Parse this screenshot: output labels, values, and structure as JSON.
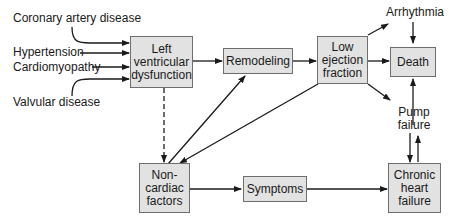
{
  "diagram": {
    "inputs": [
      {
        "id": "coronary",
        "label": "Coronary artery disease"
      },
      {
        "id": "hypertension",
        "label": "Hypertension"
      },
      {
        "id": "cardiomyopathy",
        "label": "Cardiomyopathy"
      },
      {
        "id": "valvular",
        "label": "Valvular disease"
      }
    ],
    "nodes": {
      "lv_dysfunction": "Left\nventricular\ndysfunction",
      "remodeling": "Remodeling",
      "low_ef": "Low\nejection\nfraction",
      "death": "Death",
      "arrhythmia": "Arrhythmia",
      "pump_failure": "Pump\nfailure",
      "noncardiac": "Non-\ncardiac\nfactors",
      "symptoms": "Symptoms",
      "chf": "Chronic\nheart\nfailure"
    },
    "edges": [
      {
        "from": "Coronary artery disease",
        "to": "Left ventricular dysfunction"
      },
      {
        "from": "Hypertension",
        "to": "Left ventricular dysfunction"
      },
      {
        "from": "Cardiomyopathy",
        "to": "Left ventricular dysfunction"
      },
      {
        "from": "Valvular disease",
        "to": "Left ventricular dysfunction"
      },
      {
        "from": "Left ventricular dysfunction",
        "to": "Remodeling"
      },
      {
        "from": "Left ventricular dysfunction",
        "to": "Non-cardiac factors",
        "style": "dashed"
      },
      {
        "from": "Remodeling",
        "to": "Low ejection fraction"
      },
      {
        "from": "Non-cardiac factors",
        "to": "Remodeling"
      },
      {
        "from": "Low ejection fraction",
        "to": "Non-cardiac factors"
      },
      {
        "from": "Low ejection fraction",
        "to": "Arrhythmia"
      },
      {
        "from": "Low ejection fraction",
        "to": "Death"
      },
      {
        "from": "Low ejection fraction",
        "to": "Pump failure"
      },
      {
        "from": "Arrhythmia",
        "to": "Death"
      },
      {
        "from": "Pump failure",
        "to": "Death"
      },
      {
        "from": "Pump failure",
        "to": "Chronic heart failure"
      },
      {
        "from": "Chronic heart failure",
        "to": "Pump failure"
      },
      {
        "from": "Non-cardiac factors",
        "to": "Symptoms"
      },
      {
        "from": "Symptoms",
        "to": "Chronic heart failure"
      }
    ],
    "colors": {
      "box_fill": "#e2e2e2",
      "box_border": "#6e6e6e",
      "line": "#1a1a1a"
    }
  }
}
